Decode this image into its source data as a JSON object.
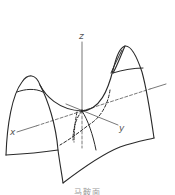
{
  "figure": {
    "type": "saddle-surface",
    "axes": {
      "x": {
        "label": "x"
      },
      "y": {
        "label": "y"
      },
      "z": {
        "label": "z"
      }
    },
    "colors": {
      "stroke": "#2a2a2a",
      "axis": "#555555",
      "background": "#ffffff"
    }
  },
  "caption": "马鞍面"
}
